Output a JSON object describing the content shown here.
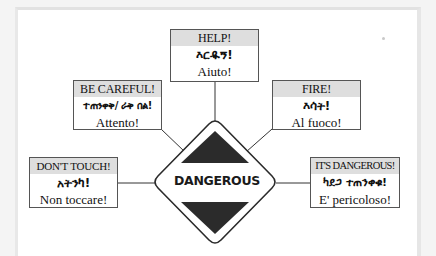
{
  "sign": {
    "label": "DANGEROUS",
    "colors": {
      "outline": "#2a2a2a",
      "fill": "#ffffff",
      "triangles": "#2b2b2b"
    }
  },
  "boxes": [
    {
      "id": "help",
      "english": "HELP!",
      "amharic": "እርዱኝ!",
      "italian": "Aiuto!"
    },
    {
      "id": "be-careful",
      "english": "BE CAREFUL!",
      "amharic": "ተጠንቀቅ/ ራቅ በል!",
      "italian": "Attento!"
    },
    {
      "id": "fire",
      "english": "FIRE!",
      "amharic": "እሳት!",
      "italian": "Al fuoco!"
    },
    {
      "id": "dont-touch",
      "english": "DON'T TOUCH!",
      "amharic": "አትንካ!",
      "italian": "Non toccare!"
    },
    {
      "id": "its-dangerous",
      "english": "IT'S DANGEROUS!",
      "amharic": "ካደጋ ተጠንቀቁ!",
      "italian": "E' pericoloso!"
    }
  ],
  "colors": {
    "header_bg": "#dedede",
    "border": "#555555",
    "page_bg": "#ffffff"
  }
}
